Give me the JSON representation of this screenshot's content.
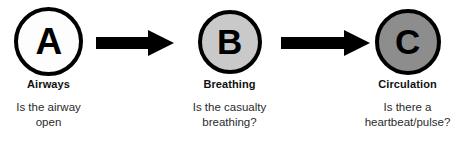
{
  "diagram": {
    "background_color": "#ffffff",
    "outline_color": "#000000"
  },
  "steps": [
    {
      "letter": "A",
      "name": "Airways",
      "question": "Is the airway\nopen",
      "fill_color": "#fdfdfd"
    },
    {
      "letter": "B",
      "name": "Breathing",
      "question": "Is the casualty\nbreathing?",
      "fill_color": "#c9c9c9"
    },
    {
      "letter": "C",
      "name": "Circulation",
      "question": "Is there a\nheartbeat/pulse?",
      "fill_color": "#8d8d8d"
    }
  ],
  "arrows": [
    {
      "name": "arrow-a-to-b",
      "direction": "right",
      "color": "#000000"
    },
    {
      "name": "arrow-b-to-c",
      "direction": "right",
      "color": "#000000"
    }
  ]
}
